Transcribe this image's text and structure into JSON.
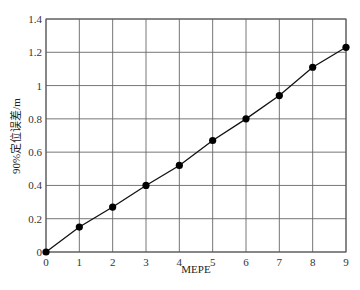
{
  "chart_data": {
    "type": "line",
    "title": "",
    "xlabel": "MEPE",
    "ylabel": "90%定位误差/m",
    "x": [
      0,
      1,
      2,
      3,
      4,
      5,
      6,
      7,
      8,
      9
    ],
    "series": [
      {
        "name": "90%定位误差",
        "values": [
          0,
          0.15,
          0.27,
          0.4,
          0.52,
          0.67,
          0.8,
          0.94,
          1.11,
          1.23
        ],
        "color": "#000000",
        "marker": "circle"
      }
    ],
    "xlim": [
      0,
      9
    ],
    "ylim": [
      0,
      1.4
    ],
    "xticks": [
      "0",
      "1",
      "2",
      "3",
      "4",
      "5",
      "6",
      "7",
      "8",
      "9"
    ],
    "yticks": [
      "0",
      "0.2",
      "0.4",
      "0.6",
      "0.8",
      "1",
      "1.2",
      "1.4"
    ],
    "grid": true,
    "legend": false
  }
}
